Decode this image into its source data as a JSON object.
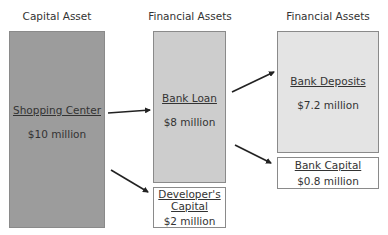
{
  "columns": [
    {
      "heading": "Capital Asset"
    },
    {
      "heading": "Financial Assets"
    },
    {
      "heading": "Financial Assets"
    }
  ],
  "boxes": {
    "shopping_center": {
      "name": "Shopping Center",
      "value": "$10 million",
      "color": "#9c9c9c"
    },
    "bank_loan": {
      "name": "Bank Loan",
      "value": "$8 million",
      "color": "#cdcdcd"
    },
    "developers_capital": {
      "name_line1": "Developer's",
      "name_line2": "Capital",
      "value": "$2 million",
      "color": "#ffffff"
    },
    "bank_deposits": {
      "name": "Bank Deposits",
      "value": "$7.2 million",
      "color": "#e4e4e4"
    },
    "bank_capital": {
      "name": "Bank Capital",
      "value": "$0.8 million",
      "color": "#ffffff"
    }
  },
  "arrows": [
    {
      "from": "Shopping Center",
      "to": "Bank Loan"
    },
    {
      "from": "Shopping Center",
      "to": "Developer's Capital"
    },
    {
      "from": "Bank Loan",
      "to": "Bank Deposits"
    },
    {
      "from": "Bank Loan",
      "to": "Bank Capital"
    }
  ]
}
